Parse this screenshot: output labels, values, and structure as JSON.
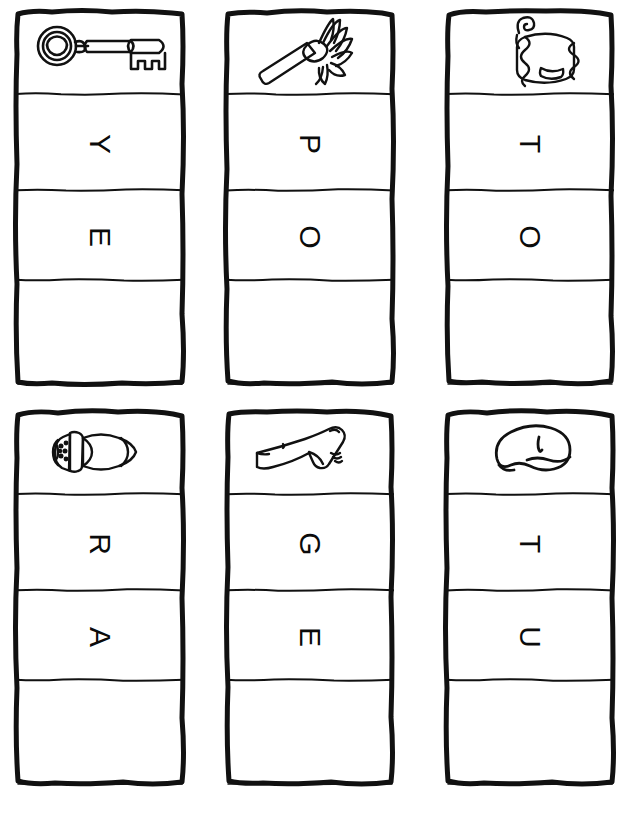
{
  "page": {
    "background_color": "#ffffff",
    "ink_color": "#111111",
    "columns": 3,
    "rows": 2,
    "cards_total": 6,
    "cells_per_card": 4,
    "letter_rotation_degrees": 90
  },
  "cards": [
    {
      "id": "card-key",
      "word": "KEY",
      "picture_icon": "key-icon",
      "picture_label": "key",
      "letters": [
        "Y",
        "E"
      ],
      "letter_1": "Y",
      "letter_2": "E",
      "blank_cell_label": ""
    },
    {
      "id": "card-mop",
      "word": "MOP",
      "picture_icon": "mop-icon",
      "picture_label": "mop",
      "letters": [
        "P",
        "O"
      ],
      "letter_1": "P",
      "letter_2": "O",
      "blank_cell_label": ""
    },
    {
      "id": "card-pot",
      "word": "POT",
      "picture_icon": "pot-icon",
      "picture_label": "pot",
      "letters": [
        "T",
        "O"
      ],
      "letter_1": "T",
      "letter_2": "O",
      "blank_cell_label": ""
    },
    {
      "id": "card-jar",
      "word": "JAR",
      "picture_icon": "jar-icon",
      "picture_label": "jar",
      "letters": [
        "R",
        "A"
      ],
      "letter_1": "R",
      "letter_2": "A",
      "blank_cell_label": ""
    },
    {
      "id": "card-leg",
      "word": "LEG",
      "picture_icon": "leg-icon",
      "picture_label": "leg",
      "letters": [
        "G",
        "E"
      ],
      "letter_1": "G",
      "letter_2": "E",
      "blank_cell_label": ""
    },
    {
      "id": "card-nut",
      "word": "NUT",
      "picture_icon": "nut-icon",
      "picture_label": "nut",
      "letters": [
        "T",
        "U"
      ],
      "letter_1": "T",
      "letter_2": "U",
      "blank_cell_label": ""
    }
  ]
}
